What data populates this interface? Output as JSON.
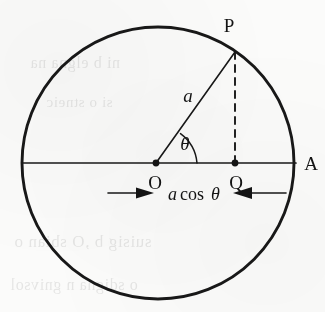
{
  "figure": {
    "background_color": "#fbfbfa",
    "ink_color": "#181818",
    "labels": {
      "center": "O",
      "point_on_circle": "P",
      "foot_of_perpendicular": "Q",
      "axis_endpoint": "A",
      "radius": "a",
      "angle": "θ",
      "projection_expression_a": "a",
      "projection_expression_rest": " cos θ",
      "projection_expression_full": "a cos θ"
    },
    "geometry": {
      "circle_center_x": 158,
      "circle_center_y": 163,
      "circle_radius": 136,
      "point_o_x": 156,
      "point_o_y": 163,
      "point_p_x": 235,
      "point_p_y": 52,
      "point_q_x": 235,
      "point_q_y": 163,
      "axis_left_x": 22,
      "axis_right_x": 296,
      "angle_arc_radius": 41,
      "angle_degrees": 54
    },
    "dimension_arrows": {
      "left_arrow_from_x": 108,
      "left_arrow_to_x": 154,
      "right_arrow_from_x": 286,
      "right_arrow_to_x": 234,
      "arrow_y": 193,
      "direction_left": "right",
      "direction_right": "left"
    },
    "bleed_through_lines": [
      {
        "text": "suisig b ,O sbian o",
        "x": 14,
        "y": 244,
        "size": 17
      },
      {
        "text": "o sdigna n gnivsol",
        "x": 10,
        "y": 288,
        "size": 16
      },
      {
        "text": "ni b elgna na",
        "x": 30,
        "y": 66,
        "size": 16
      },
      {
        "text": "si o stneic",
        "x": 46,
        "y": 106,
        "size": 15
      }
    ]
  }
}
